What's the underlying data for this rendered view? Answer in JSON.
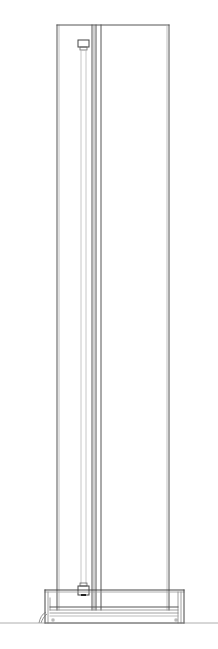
{
  "drawing": {
    "title": "",
    "width": 218,
    "height": 649,
    "background": "#ffffff",
    "colors": {
      "main": "#555555",
      "light": "#a8a8a8",
      "dark": "#222222"
    },
    "column": {
      "x1": 57,
      "x2": 169,
      "top": 25,
      "bottom": 610
    },
    "tube": {
      "x1": 80,
      "x2": 88,
      "top": 40,
      "bottom": 588
    },
    "divider": {
      "x1": 92,
      "x2": 97,
      "x3": 101
    },
    "base": {
      "x1": 45,
      "x2": 184,
      "top": 590,
      "bottom": 623
    },
    "floor_y": 623
  }
}
